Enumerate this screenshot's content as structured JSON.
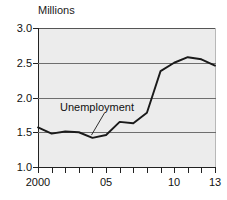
{
  "chart_data": {
    "type": "line",
    "title": "",
    "ylabel": "Millions",
    "xlabel": "",
    "unit_label": "Millions",
    "x": [
      2000,
      2001,
      2002,
      2003,
      2004,
      2005,
      2006,
      2007,
      2008,
      2009,
      2010,
      2011,
      2012,
      2013
    ],
    "series": [
      {
        "name": "Unemployment",
        "values": [
          1.57,
          1.48,
          1.51,
          1.5,
          1.42,
          1.46,
          1.65,
          1.63,
          1.78,
          2.38,
          2.5,
          2.58,
          2.55,
          2.46
        ]
      }
    ],
    "xlim": [
      2000,
      2013
    ],
    "ylim": [
      1.0,
      3.0
    ],
    "ytick_values": [
      1.0,
      1.5,
      2.0,
      2.5,
      3.0
    ],
    "ytick_labels": [
      "1.0",
      "1.5",
      "2.0",
      "2.5",
      "3.0"
    ],
    "xtick_values": [
      2000,
      2001,
      2002,
      2003,
      2004,
      2005,
      2006,
      2007,
      2008,
      2009,
      2010,
      2011,
      2012,
      2013
    ],
    "xtick_labels": [
      "2000",
      "",
      "",
      "",
      "",
      "05",
      "",
      "",
      "",
      "",
      "10",
      "",
      "",
      "13"
    ],
    "grid": "horizontal",
    "legend": "none",
    "annotations": [
      {
        "text": "Unemployment",
        "points_to_x": 2004,
        "points_to_y": 1.43
      }
    ],
    "colors": {
      "line": "#1a1a1a",
      "plot_background": "#ececec",
      "gridline": "#6e6e6e",
      "axis": "#222222",
      "text": "#111111"
    }
  }
}
